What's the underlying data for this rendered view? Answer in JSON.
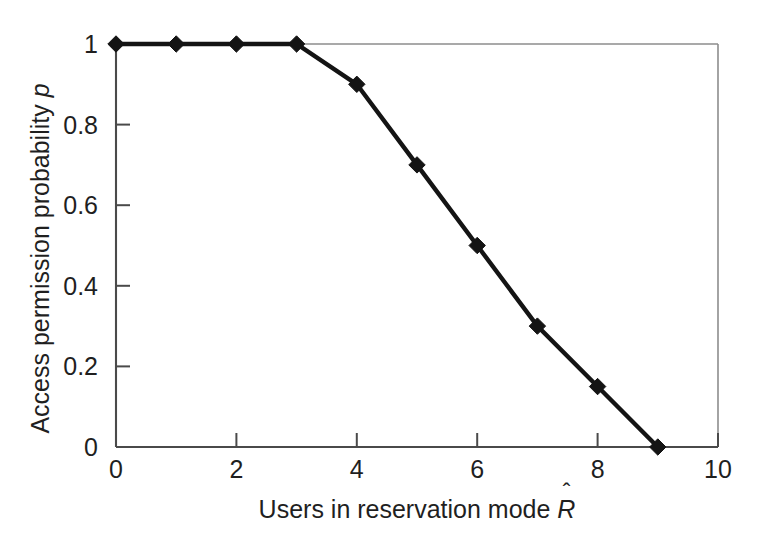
{
  "figure": {
    "background_color": "#ffffff",
    "line_color": "#1a1a1a",
    "frame_color": "#8a8a8a",
    "axis_color": "#3a3a3a"
  },
  "axes": {
    "x_title_prefix": "Users in reservation mode ",
    "x_title_symbol": "R",
    "x_title_accent": "ˆ",
    "y_title_prefix": "Access permission probability ",
    "y_title_symbol": "p",
    "x_ticks": [
      "0",
      "2",
      "4",
      "6",
      "8",
      "10"
    ],
    "y_ticks": [
      "0",
      "0.2",
      "0.4",
      "0.6",
      "0.8",
      "1"
    ]
  },
  "chart_data": {
    "type": "line",
    "title": "",
    "subtitle": "",
    "xlabel": "Users in reservation mode R̂",
    "ylabel": "Access permission probability p",
    "xlim": [
      0,
      10
    ],
    "ylim": [
      0,
      1
    ],
    "xticks": [
      0,
      2,
      4,
      6,
      8,
      10
    ],
    "yticks": [
      0,
      0.2,
      0.4,
      0.6,
      0.8,
      1
    ],
    "grid": false,
    "legend": null,
    "legend_position": "none",
    "marker": "diamond",
    "x": [
      0,
      1,
      2,
      3,
      4,
      5,
      6,
      7,
      8,
      9
    ],
    "values": [
      1.0,
      1.0,
      1.0,
      1.0,
      0.9,
      0.7,
      0.5,
      0.3,
      0.15,
      0.0
    ],
    "series": [
      {
        "name": "Access permission probability",
        "x": [
          0,
          1,
          2,
          3,
          4,
          5,
          6,
          7,
          8,
          9
        ],
        "values": [
          1.0,
          1.0,
          1.0,
          1.0,
          0.9,
          0.7,
          0.5,
          0.3,
          0.15,
          0.0
        ]
      }
    ],
    "annotations": []
  }
}
